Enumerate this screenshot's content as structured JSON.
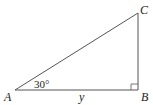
{
  "diagram": {
    "type": "right-triangle",
    "vertices": {
      "A": {
        "label": "A"
      },
      "B": {
        "label": "B"
      },
      "C": {
        "label": "C"
      }
    },
    "angle_A": "30°",
    "side_AB": "y",
    "right_angle_at": "B",
    "colors": {
      "stroke": "#444444",
      "text": "#222222"
    }
  }
}
